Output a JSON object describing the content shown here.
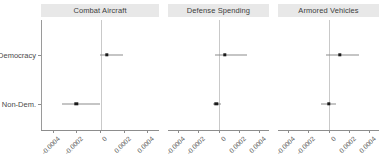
{
  "chart_data": {
    "type": "scatter",
    "title": "",
    "subtitle": "",
    "xlabel": "",
    "ylabel": "",
    "orientation": "horizontal",
    "plot_style": "dot-whisker coefficient plot, faceted",
    "grid": false,
    "legend": null,
    "zero_reference_line": 0,
    "xlim": [
      -0.0005,
      0.0005
    ],
    "xticks": [
      -0.0004,
      -0.0002,
      0,
      0.0002,
      0.0004
    ],
    "xticklabels": [
      "-0.0004",
      "-0.0002",
      "0",
      "0.0002",
      "0.0004"
    ],
    "categories": [
      "Democracy",
      "Non-Dem."
    ],
    "facets": [
      {
        "label": "Combat Aircraft",
        "points": [
          {
            "group": "Democracy",
            "estimate": 5e-05,
            "ci_low": -1e-05,
            "ci_high": 0.00019
          },
          {
            "group": "Non-Dem.",
            "estimate": -0.00021,
            "ci_low": -0.00033,
            "ci_high": -1e-05
          }
        ]
      },
      {
        "label": "Defense Spending",
        "points": [
          {
            "group": "Democracy",
            "estimate": 6e-05,
            "ci_low": -3e-05,
            "ci_high": 0.00028
          },
          {
            "group": "Non-Dem.",
            "estimate": -2e-05,
            "ci_low": -5e-05,
            "ci_high": 2e-05
          }
        ]
      },
      {
        "label": "Armored Vehicles",
        "points": [
          {
            "group": "Democracy",
            "estimate": 0.00011,
            "ci_low": -2e-05,
            "ci_high": 0.0003
          },
          {
            "group": "Non-Dem.",
            "estimate": 0.0,
            "ci_low": -7e-05,
            "ci_high": 7e-05
          }
        ]
      }
    ],
    "colors": {
      "point": "#1b1b1b",
      "interval": "#8c8c8c",
      "zero_line": "#c9c9c9",
      "strip_background": "#e8e8e8",
      "axis": "#8d8d8d",
      "background": "#ffffff"
    }
  },
  "axes": {
    "y_categories": [
      {
        "label": "Democracy"
      },
      {
        "label": "Non-Dem."
      }
    ]
  },
  "strips": [
    {
      "label": "Combat Aircraft"
    },
    {
      "label": "Defense Spending"
    },
    {
      "label": "Armored Vehicles"
    }
  ]
}
